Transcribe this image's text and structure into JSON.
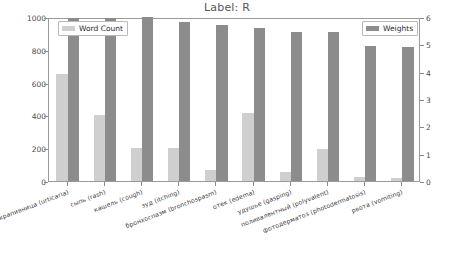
{
  "chart_data": {
    "type": "bar",
    "title": "Label: R",
    "xlabel": "",
    "ylabel": "",
    "grid": false,
    "categories": [
      "крапивница (urticaria)",
      "сыпь (rash)",
      "кашель (cough)",
      "зуд (itching)",
      "бронхоспазм (bronchospasm)",
      "отек (edema)",
      "удушье (gasping)",
      "поливалентный (polyvalent)",
      "фотодерматоз (photodermatosis)",
      "рвота (vomiting)"
    ],
    "series": [
      {
        "name": "Word Count",
        "axis": "left",
        "color": "#cfcfcf",
        "values": [
          655,
          400,
          200,
          200,
          70,
          415,
          55,
          195,
          25,
          20
        ]
      },
      {
        "name": "Weights",
        "axis": "right",
        "color": "#8c8c8c",
        "values": [
          5.95,
          5.95,
          6.0,
          5.8,
          5.7,
          5.6,
          5.45,
          5.45,
          4.95,
          4.9
        ]
      }
    ],
    "left_axis": {
      "label": "",
      "ylim": [
        0,
        1000
      ],
      "ticks": [
        0,
        200,
        400,
        600,
        800,
        1000
      ],
      "tick_labels": [
        "0",
        "200",
        "400",
        "600",
        "800",
        "1000"
      ]
    },
    "right_axis": {
      "label": "",
      "ylim": [
        0,
        6
      ],
      "ticks": [
        0,
        1,
        2,
        3,
        4,
        5,
        6
      ],
      "tick_labels": [
        "0",
        "1",
        "2",
        "3",
        "4",
        "5",
        "6"
      ]
    },
    "legend": [
      {
        "label": "Word Count",
        "position": "upper-left",
        "color": "#cfcfcf"
      },
      {
        "label": "Weights",
        "position": "upper-right",
        "color": "#8c8c8c"
      }
    ]
  }
}
